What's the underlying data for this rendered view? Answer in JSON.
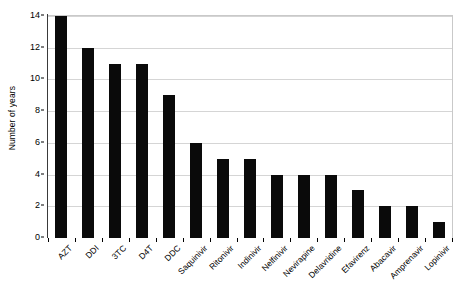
{
  "chart_data": {
    "type": "bar",
    "title": "",
    "subtitle": "",
    "xlabel": "",
    "ylabel": "Number of years",
    "ylim": [
      0,
      14
    ],
    "ytick_values": [
      0,
      2,
      4,
      6,
      8,
      10,
      12,
      14
    ],
    "ytick_labels": [
      "0",
      "2",
      "4",
      "6",
      "8",
      "10",
      "12",
      "14"
    ],
    "grid": true,
    "grid_axis": "y",
    "legend": false,
    "legend_position": "none",
    "bar_color": "#0a0a0a",
    "plot_background": "#ffffff",
    "gridline_color": "#d5d5d5",
    "axis_color": "#3a3a3a",
    "categories": [
      "AZT",
      "DDI",
      "3TC",
      "D4T",
      "DDC",
      "Saquinivir",
      "Ritonivir",
      "Indinivir",
      "Nelfinivir",
      "Nevirapine",
      "Delavridine",
      "Efavirenz",
      "Abacavir",
      "Amprenavir",
      "Lopinivir"
    ],
    "values": [
      14,
      12,
      11,
      11,
      9,
      6,
      5,
      5,
      4,
      4,
      4,
      3,
      2,
      2,
      1
    ]
  }
}
